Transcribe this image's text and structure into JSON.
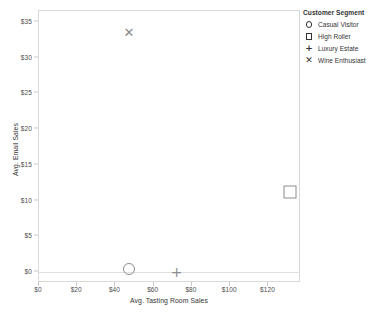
{
  "chart_data": {
    "type": "scatter",
    "title": "",
    "xlabel": "Avg. Tasting Room Sales",
    "ylabel": "Avg. Email Sales",
    "xlim": [
      0,
      137
    ],
    "ylim": [
      -1.5,
      36.5
    ],
    "xticks": [
      "$0",
      "$20",
      "$40",
      "$60",
      "$80",
      "$100",
      "$120"
    ],
    "xtick_values": [
      0,
      20,
      40,
      60,
      80,
      100,
      120
    ],
    "yticks": [
      "$0",
      "$5",
      "$10",
      "$15",
      "$20",
      "$25",
      "$30",
      "$35"
    ],
    "ytick_values": [
      0,
      5,
      10,
      15,
      20,
      25,
      30,
      35
    ],
    "grid": false,
    "legend_position": "right",
    "legend_title": "Customer Segment",
    "series": [
      {
        "name": "Casual Visitor",
        "marker": "circle",
        "x": 47,
        "y": 0.5
      },
      {
        "name": "High Roller",
        "marker": "square",
        "x": 131,
        "y": 11.2
      },
      {
        "name": "Luxury Estate",
        "marker": "plus",
        "x": 72,
        "y": 0.0
      },
      {
        "name": "Wine Enthusiast",
        "marker": "ex",
        "x": 47,
        "y": 33.5
      }
    ],
    "marker_color": "#8c8c8c",
    "axis_color": "#d9d9d9"
  },
  "legend": {
    "title": "Customer Segment",
    "items": [
      {
        "label": "Casual Visitor",
        "glyph": "circle-marker-icon"
      },
      {
        "label": "High Roller",
        "glyph": "square-marker-icon"
      },
      {
        "label": "Luxury Estate",
        "glyph": "plus-marker-icon"
      },
      {
        "label": "Wine Enthusiast",
        "glyph": "x-marker-icon"
      }
    ]
  },
  "glyphs": {
    "plus": "+",
    "ex": "✕"
  }
}
